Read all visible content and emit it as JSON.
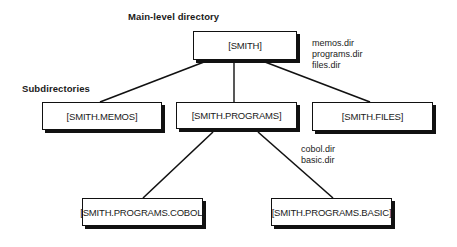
{
  "labels": {
    "main_level": "Main-level  directory",
    "subdirectories": "Subdirectories"
  },
  "nodes": {
    "root": "[SMITH]",
    "memos": "[SMITH.MEMOS]",
    "programs": "[SMITH.PROGRAMS]",
    "files": "[SMITH.FILES]",
    "cobol": "[SMITH.PROGRAMS.COBOL]",
    "basic": "[SMITH.PROGRAMS.BASIC]"
  },
  "root_files": [
    "memos.dir",
    "programs.dir",
    "files.dir"
  ],
  "programs_files": [
    "cobol.dir",
    "basic.dir"
  ],
  "edges": [
    {
      "from": "[SMITH]",
      "to": "[SMITH.MEMOS]"
    },
    {
      "from": "[SMITH]",
      "to": "[SMITH.PROGRAMS]"
    },
    {
      "from": "[SMITH]",
      "to": "[SMITH.FILES]"
    },
    {
      "from": "[SMITH.PROGRAMS]",
      "to": "[SMITH.PROGRAMS.COBOL]"
    },
    {
      "from": "[SMITH.PROGRAMS]",
      "to": "[SMITH.PROGRAMS.BASIC]"
    }
  ]
}
